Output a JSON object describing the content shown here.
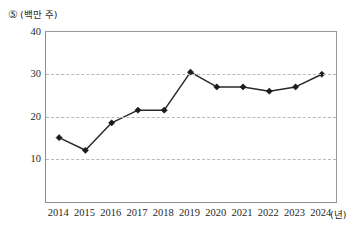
{
  "chart_data": {
    "type": "line",
    "title": "",
    "label_marker": "⑤",
    "ylabel": "(백만 주)",
    "xlabel": "(년)",
    "categories": [
      "2014",
      "2015",
      "2016",
      "2017",
      "2018",
      "2019",
      "2020",
      "2021",
      "2022",
      "2023",
      "2024"
    ],
    "values": [
      15,
      12,
      18.5,
      21.5,
      21.5,
      30.5,
      27,
      27,
      26,
      27,
      30
    ],
    "series": [
      {
        "name": "",
        "values": [
          15,
          12,
          18.5,
          21.5,
          21.5,
          30.5,
          27,
          27,
          26,
          27,
          30
        ]
      }
    ],
    "ylim": [
      0,
      40
    ],
    "yticks": [
      10,
      20,
      30,
      40
    ],
    "ytick_labels": [
      "10",
      "20",
      "30",
      "40"
    ],
    "xlim": [
      "2014",
      "2024"
    ],
    "grid": "horizontal-dashed",
    "legend": "none",
    "marker_style": "diamond",
    "line_color": "#2a2a2a",
    "grid_color": "#b9b9b9",
    "axis_color": "#8c8c8c"
  }
}
